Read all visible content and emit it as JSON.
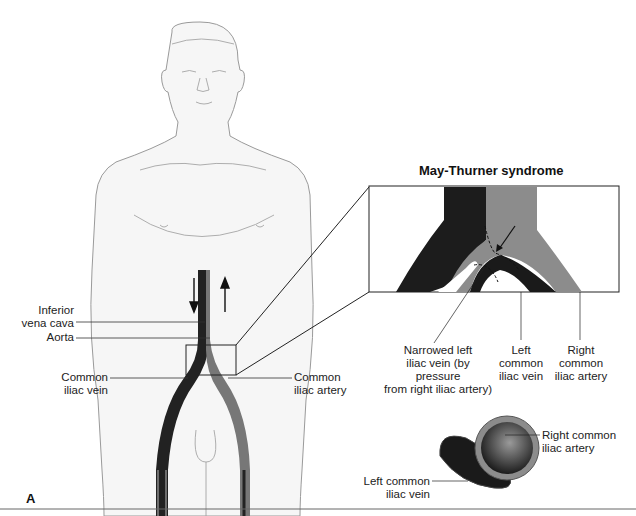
{
  "figure": {
    "panel_label": "A",
    "inset_title": "May-Thurner syndrome",
    "body_labels": {
      "ivc": "Inferior\nvena cava",
      "aorta": "Aorta",
      "common_iliac_vein": "Common\niliac vein",
      "common_iliac_artery": "Common\niliac artery"
    },
    "inset_labels": {
      "narrowed": "Narrowed left\niliac vein (by pressure\nfrom right iliac artery)",
      "left_vein": "Left\ncommon\niliac vein",
      "right_artery": "Right\ncommon\niliac artery"
    },
    "cross_section_labels": {
      "artery": "Right common\niliac artery",
      "vein": "Left common\niliac vein"
    },
    "colors": {
      "vein": "#1a1a1a",
      "artery": "#8a8a8a",
      "skin": "#f5f5f5",
      "outline": "#8c8c8c"
    }
  }
}
